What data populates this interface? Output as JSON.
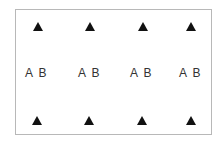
{
  "diagram": {
    "frame_color": "#b8b8b8",
    "marker_color": "#111111",
    "top_markers": [
      {
        "icon": "triangle-up-icon",
        "x": 38
      },
      {
        "icon": "triangle-up-icon",
        "x": 90
      },
      {
        "icon": "triangle-up-icon",
        "x": 143
      },
      {
        "icon": "triangle-up-icon",
        "x": 191
      }
    ],
    "labels": [
      {
        "a": "A",
        "b": "B"
      },
      {
        "a": "A",
        "b": "B"
      },
      {
        "a": "A",
        "b": "B"
      },
      {
        "a": "A",
        "b": "B"
      }
    ],
    "bottom_markers": [
      {
        "icon": "triangle-up-icon",
        "x": 37
      },
      {
        "icon": "triangle-up-icon",
        "x": 89
      },
      {
        "icon": "triangle-up-icon",
        "x": 142
      },
      {
        "icon": "triangle-up-icon",
        "x": 191
      }
    ]
  }
}
